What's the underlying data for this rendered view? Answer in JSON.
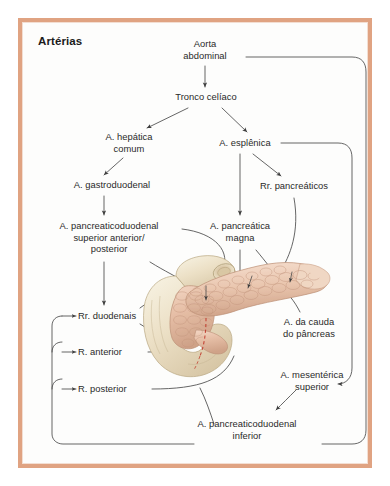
{
  "figure": {
    "title": "Artérias",
    "language": "pt-BR",
    "frame_color": "#e0a382",
    "text_color": "#2a2a2a",
    "connector_color": "#4a4a4a",
    "duodenum_color": "#ece0c8",
    "pancreas_color": "#e8c2ab",
    "duct_color": "#c0392b"
  },
  "nodes": [
    {
      "id": "aorta",
      "label": "Aorta\nabdominal",
      "x": 205,
      "y": 44,
      "w": 78
    },
    {
      "id": "tronco_celiaco",
      "label": "Tronco celíaco",
      "x": 206,
      "y": 97,
      "w": 96
    },
    {
      "id": "hepatica_comum",
      "label": "A. hepática\ncomum",
      "x": 129,
      "y": 137,
      "w": 78
    },
    {
      "id": "esplenica",
      "label": "A. esplênica",
      "x": 245,
      "y": 143,
      "w": 78
    },
    {
      "id": "gastroduodenal",
      "label": "A. gastroduodenal",
      "x": 112,
      "y": 185,
      "w": 110
    },
    {
      "id": "rr_pancreaticos",
      "label": "Rr. pancreáticos",
      "x": 294,
      "y": 186,
      "w": 102
    },
    {
      "id": "apd_superior",
      "label": "A. pancreaticoduodenal\nsuperior anterior/\nposterior",
      "x": 109,
      "y": 226,
      "w": 144
    },
    {
      "id": "pancreatica_magna",
      "label": "A. pancreática\nmagna",
      "x": 240,
      "y": 226,
      "w": 92
    },
    {
      "id": "rr_duodenais",
      "label": "Rr. duodenais",
      "x": 108,
      "y": 316,
      "w": 86
    },
    {
      "id": "r_anterior",
      "label": "R. anterior",
      "x": 107,
      "y": 352,
      "w": 72
    },
    {
      "id": "r_posterior",
      "label": "R. posterior",
      "x": 110,
      "y": 389,
      "w": 78
    },
    {
      "id": "cauda_pancreas",
      "label": "A. da cauda\ndo pâncreas",
      "x": 309,
      "y": 322,
      "w": 86
    },
    {
      "id": "mesenterica_sup",
      "label": "A. mesentérica\nsuperior",
      "x": 312,
      "y": 375,
      "w": 96
    },
    {
      "id": "apd_inferior",
      "label": "A. pancreaticoduodenal\ninferior",
      "x": 247,
      "y": 424,
      "w": 144
    }
  ],
  "illustration": {
    "name": "pancreas-duodenum-illustration",
    "parts": [
      "duodenum C-loop",
      "pancreas head",
      "pancreas body",
      "pancreas tail",
      "pancreatic duct"
    ]
  }
}
